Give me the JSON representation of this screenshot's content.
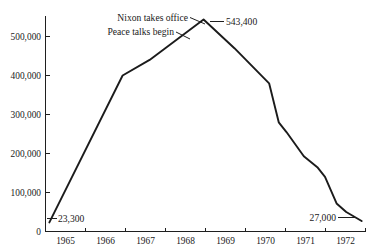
{
  "chart_data": {
    "type": "line",
    "title": "",
    "xlabel": "",
    "ylabel": "",
    "xlim": [
      1964.5,
      1972.8
    ],
    "ylim": [
      0,
      560000
    ],
    "grid": false,
    "legend_position": "none",
    "y_ticks": [
      "0",
      "100,000",
      "200,000",
      "300,000",
      "400,000",
      "500,000"
    ],
    "y_tick_values": [
      0,
      100000,
      200000,
      300000,
      400000,
      500000
    ],
    "x_ticks": [
      "1965",
      "1966",
      "1967",
      "1968",
      "1969",
      "1970",
      "1971",
      "1972"
    ],
    "x_tick_values": [
      1965,
      1966,
      1967,
      1968,
      1969,
      1970,
      1971,
      1972
    ],
    "series": [
      {
        "name": "U.S. troops in Vietnam",
        "x": [
          1964.6,
          1966.5,
          1967.2,
          1968.6,
          1969.4,
          1970.3,
          1970.55,
          1970.75,
          1971.2,
          1971.55,
          1971.75,
          1972.05,
          1972.3,
          1972.7
        ],
        "values": [
          23300,
          400000,
          440000,
          543400,
          470000,
          380000,
          280000,
          255000,
          193000,
          165000,
          140000,
          72000,
          50000,
          27000
        ]
      }
    ],
    "annotations": [
      {
        "name": "peak-value",
        "label": "543,400",
        "x": 1968.6,
        "value": 543400
      },
      {
        "name": "nixon-takes-office",
        "label": "Nixon takes office",
        "x": 1969.0,
        "value": 543400
      },
      {
        "name": "peace-talks-begin",
        "label": "Peace talks begin",
        "x": 1968.4,
        "value": 500000
      },
      {
        "name": "start-value",
        "label": "23,300",
        "x": 1964.6,
        "value": 23300
      },
      {
        "name": "end-value",
        "label": "27,000",
        "x": 1972.7,
        "value": 27000
      }
    ],
    "axis_color": "#1f1f1f",
    "line_color": "#1b1b1b",
    "background_color": "#ffffff"
  }
}
